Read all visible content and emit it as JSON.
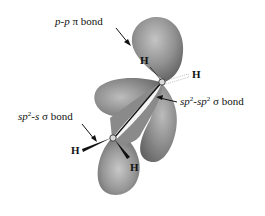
{
  "figure": {
    "labels": {
      "pi_bond": {
        "part1": "p-p",
        "part2": " π bond"
      },
      "sigma_cc": {
        "part1": "sp",
        "sup1": "2",
        "part2": "-sp",
        "sup2": "2",
        "part3": " σ bond"
      },
      "sigma_ch": {
        "part1": "sp",
        "sup1": "2",
        "part2": "-s",
        "part3": " σ bond"
      }
    },
    "atoms": {
      "h_top_left": "H",
      "h_top_right": "H",
      "h_bottom_left": "H",
      "h_bottom_right": "H"
    },
    "colors": {
      "lobe_fill": "#8c8c8c",
      "lobe_highlight": "#c8c8c8",
      "lobe_shadow": "#5a5a5a",
      "text": "#111111"
    }
  }
}
